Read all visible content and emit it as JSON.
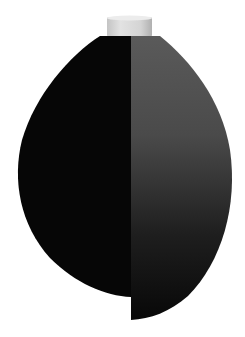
{
  "image": {
    "subject": "two-tone sculpted vase with cylindrical neck",
    "background": "#ffffff",
    "colors": {
      "neck_light": "#e2e2e2",
      "neck_shade": "#b8b8b8",
      "left_half": "#060606",
      "right_half_top": "#5a5a5a",
      "right_half_bottom": "#0a0a0a"
    }
  }
}
